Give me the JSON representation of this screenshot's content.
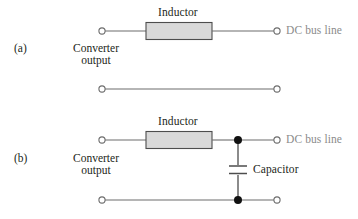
{
  "figure": {
    "type": "circuit-diagram",
    "background_color": "#ffffff",
    "wire_color": "#6d6d6d",
    "node_color": "#111111",
    "text_color": "#231f20",
    "muted_text_color": "#8b8b8b",
    "inductor_fill": "#d9d9d9",
    "inductor_stroke": "#4d4d4d"
  },
  "panels": [
    {
      "id": "a",
      "tag": "(a)",
      "source_label_line1": "Converter",
      "source_label_line2": "output",
      "inductor_label": "Inductor",
      "dc_bus_label": "DC bus line",
      "has_capacitor": false,
      "capacitor_label": null,
      "terminals": 4,
      "junction_dots": 0
    },
    {
      "id": "b",
      "tag": "(b)",
      "source_label_line1": "Converter",
      "source_label_line2": "output",
      "inductor_label": "Inductor",
      "dc_bus_label": "DC bus line",
      "has_capacitor": true,
      "capacitor_label": "Capacitor",
      "terminals": 4,
      "junction_dots": 2
    }
  ],
  "icons": {
    "terminal": "open-circle-terminal",
    "junction": "filled-junction-dot",
    "inductor": "inductor-box",
    "capacitor": "capacitor-plates"
  }
}
